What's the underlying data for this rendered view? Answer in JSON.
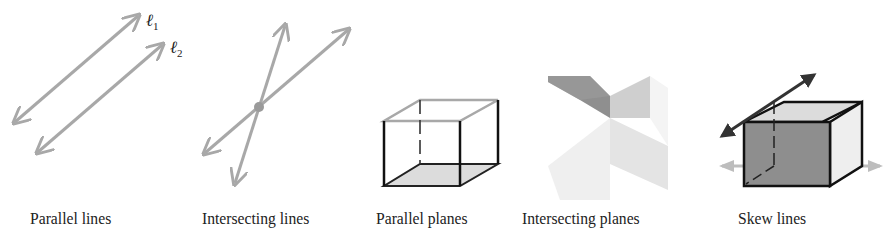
{
  "figures": [
    {
      "id": "parallel-lines",
      "caption": "Parallel lines",
      "labels": [
        "ℓ1",
        "ℓ2"
      ]
    },
    {
      "id": "intersecting-lines",
      "caption": "Intersecting lines"
    },
    {
      "id": "parallel-planes",
      "caption": "Parallel planes"
    },
    {
      "id": "intersecting-planes",
      "caption": "Intersecting planes"
    },
    {
      "id": "skew-lines",
      "caption": "Skew lines"
    }
  ],
  "line_labels": {
    "l1_main": "ℓ",
    "l1_sub": "1",
    "l2_main": "ℓ",
    "l2_sub": "2"
  },
  "colors": {
    "line_gray": "#a8a8a8",
    "edge_dark": "#111111",
    "face_dark": "#8e8e8e",
    "face_mid": "#c8c8c8",
    "face_light": "#e6e6e6"
  }
}
